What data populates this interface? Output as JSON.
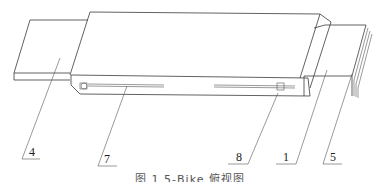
{
  "figure": {
    "caption": "图 1 5-Bike 俯视图",
    "callouts": [
      {
        "id": "4",
        "label": "4",
        "x": 29,
        "y": 155
      },
      {
        "id": "7",
        "label": "7",
        "x": 104,
        "y": 162
      },
      {
        "id": "8",
        "label": "8",
        "x": 237,
        "y": 161
      },
      {
        "id": "1",
        "label": "1",
        "x": 283,
        "y": 161
      },
      {
        "id": "5",
        "label": "5",
        "x": 330,
        "y": 161
      }
    ]
  }
}
